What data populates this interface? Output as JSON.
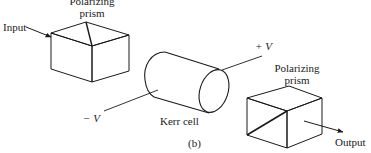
{
  "figure": {
    "panel_label": "(b)",
    "stroke_color": "#1a1a1a",
    "background": "#ffffff"
  },
  "input_prism": {
    "label_line1": "Polarizing",
    "label_line2": "prism"
  },
  "input_arrow": {
    "label": "Input"
  },
  "kerr_cell": {
    "label": "Kerr cell",
    "positive_terminal": "+ V",
    "negative_terminal": "− V"
  },
  "output_prism": {
    "label_line1": "Polarizing",
    "label_line2": "prism"
  },
  "output_arrow": {
    "label": "Output"
  }
}
